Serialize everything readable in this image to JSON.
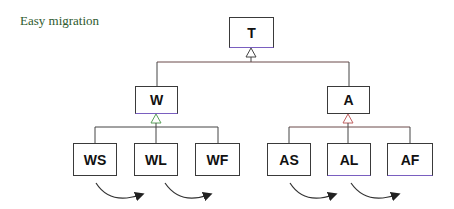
{
  "title": "Easy migration",
  "nodes": {
    "T": "T",
    "W": "W",
    "A": "A",
    "WS": "WS",
    "WL": "WL",
    "WF": "WF",
    "AS": "AS",
    "AL": "AL",
    "AF": "AF"
  },
  "colors": {
    "title": "#2e5a2e",
    "line": "#3a3a3a",
    "accent_purple": "#7a5fc0",
    "accent_red": "#c06060",
    "accent_green": "#5aa05a"
  }
}
